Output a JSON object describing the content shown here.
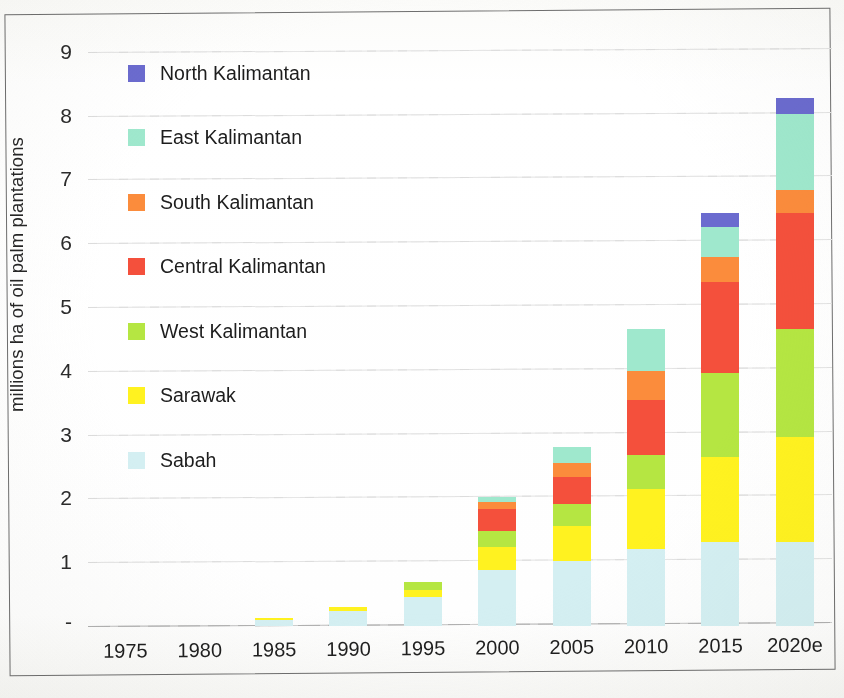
{
  "chart_data": {
    "type": "bar",
    "stacked": true,
    "title": "",
    "xlabel": "",
    "ylabel": "millions ha of oil palm plantations",
    "ylim": [
      0,
      9
    ],
    "yticks": [
      "-",
      "1",
      "2",
      "3",
      "4",
      "5",
      "6",
      "7",
      "8",
      "9"
    ],
    "grid": true,
    "legend_position": "inside-left",
    "categories": [
      "1975",
      "1980",
      "1985",
      "1990",
      "1995",
      "2000",
      "2005",
      "2010",
      "2015",
      "2020e"
    ],
    "series": [
      {
        "name": "Sabah",
        "color": "#d4eff2",
        "values": [
          0.0,
          0.0,
          0.1,
          0.23,
          0.45,
          0.88,
          1.02,
          1.2,
          1.32,
          1.32
        ]
      },
      {
        "name": "Sarawak",
        "color": "#fff220",
        "values": [
          0.0,
          0.0,
          0.03,
          0.07,
          0.12,
          0.36,
          0.55,
          0.95,
          1.33,
          1.65
        ]
      },
      {
        "name": "West Kalimantan",
        "color": "#b5e642",
        "values": [
          0.0,
          0.0,
          0.0,
          0.0,
          0.12,
          0.25,
          0.35,
          0.53,
          1.32,
          1.68
        ]
      },
      {
        "name": "Central Kalimantan",
        "color": "#f4503c",
        "values": [
          0.0,
          0.0,
          0.0,
          0.0,
          0.0,
          0.34,
          0.42,
          0.87,
          1.43,
          1.83
        ]
      },
      {
        "name": "South Kalimantan",
        "color": "#fb8c3c",
        "values": [
          0.0,
          0.0,
          0.0,
          0.0,
          0.0,
          0.12,
          0.21,
          0.44,
          0.38,
          0.35
        ]
      },
      {
        "name": "East Kalimantan",
        "color": "#9fe8cd",
        "values": [
          0.0,
          0.0,
          0.0,
          0.0,
          0.0,
          0.08,
          0.26,
          0.66,
          0.47,
          1.2
        ]
      },
      {
        "name": "North Kalimantan",
        "color": "#6b6bcf",
        "values": [
          0.0,
          0.0,
          0.0,
          0.0,
          0.0,
          0.0,
          0.0,
          0.0,
          0.22,
          0.25
        ]
      }
    ],
    "totals": [
      0.0,
      0.0,
      0.13,
      0.3,
      0.69,
      2.03,
      2.81,
      4.65,
      6.47,
      8.28
    ]
  },
  "legend": {
    "items": [
      {
        "label": "North Kalimantan",
        "color": "#6b6bcf"
      },
      {
        "label": "East Kalimantan",
        "color": "#9fe8cd"
      },
      {
        "label": "South Kalimantan",
        "color": "#fb8c3c"
      },
      {
        "label": "Central Kalimantan",
        "color": "#f4503c"
      },
      {
        "label": "West Kalimantan",
        "color": "#b5e642"
      },
      {
        "label": "Sarawak",
        "color": "#fff220"
      },
      {
        "label": "Sabah",
        "color": "#d4eff2"
      }
    ]
  }
}
